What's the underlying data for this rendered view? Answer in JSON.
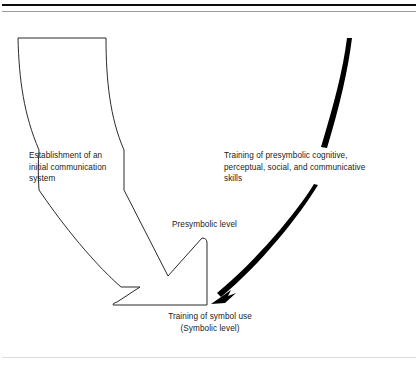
{
  "figure": {
    "background_color": "#ffffff",
    "line_color": "#2b2b2b",
    "text_color": "#1a1a1a",
    "accent_color": "#000000"
  },
  "rules": {
    "top_thick_color": "#0d0d0d",
    "top_thin_color": "#9a9a9a",
    "bottom_color": "#dcdcdc"
  },
  "labels": {
    "left_source": "Establishment of an\ninitial communication\nsystem",
    "right_source": "Training of presymbolic cognitive,\nperceptual, social, and communicative\nskills",
    "middle_level": "Presymbolic level",
    "bottom_outcome": "Training of symbol use\n(Symbolic level)"
  },
  "shapes": {
    "funnel": "open-funnel-outline",
    "block_arrow": "chevron-block-arrow-outline",
    "curved_arrow": "tapered-black-curved-arrow"
  }
}
